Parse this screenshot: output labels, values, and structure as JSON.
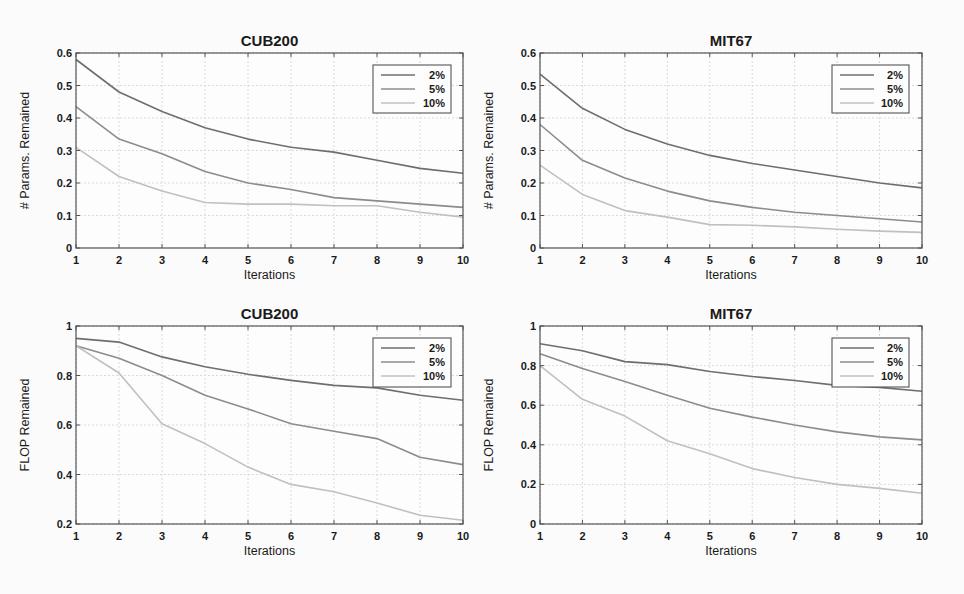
{
  "chart_data": [
    {
      "type": "line",
      "id": "cub200-params",
      "title": "CUB200",
      "xlabel": "Iterations",
      "ylabel": "# Params. Remained",
      "x": [
        1,
        2,
        3,
        4,
        5,
        6,
        7,
        8,
        9,
        10
      ],
      "xlim": [
        1,
        10
      ],
      "ylim": [
        0,
        0.6
      ],
      "yticks": [
        0,
        0.1,
        0.2,
        0.3,
        0.4,
        0.5,
        0.6
      ],
      "ytick_labels": [
        "0",
        "0.1",
        "0.2",
        "0.3",
        "0.4",
        "0.5",
        "0.6"
      ],
      "grid": true,
      "legend_position": "upper right",
      "series": [
        {
          "name": "2%",
          "values": [
            0.58,
            0.48,
            0.42,
            0.37,
            0.335,
            0.31,
            0.295,
            0.27,
            0.245,
            0.23
          ]
        },
        {
          "name": "5%",
          "values": [
            0.435,
            0.335,
            0.29,
            0.235,
            0.2,
            0.18,
            0.155,
            0.145,
            0.135,
            0.125
          ]
        },
        {
          "name": "10%",
          "values": [
            0.31,
            0.22,
            0.175,
            0.14,
            0.135,
            0.135,
            0.13,
            0.13,
            0.11,
            0.095
          ]
        }
      ],
      "frame": {
        "left": 76,
        "top": 53,
        "right": 463,
        "bottom": 248
      },
      "legend_box": {
        "x": 373,
        "y": 65,
        "w": 78,
        "h": 48
      }
    },
    {
      "type": "line",
      "id": "mit67-params",
      "title": "MIT67",
      "xlabel": "Iterations",
      "ylabel": "# Params. Remained",
      "x": [
        1,
        2,
        3,
        4,
        5,
        6,
        7,
        8,
        9,
        10
      ],
      "xlim": [
        1,
        10
      ],
      "ylim": [
        0,
        0.6
      ],
      "yticks": [
        0,
        0.1,
        0.2,
        0.3,
        0.4,
        0.5,
        0.6
      ],
      "ytick_labels": [
        "0",
        "0.1",
        "0.2",
        "0.3",
        "0.4",
        "0.5",
        "0.6"
      ],
      "grid": true,
      "legend_position": "upper right",
      "series": [
        {
          "name": "2%",
          "values": [
            0.535,
            0.43,
            0.365,
            0.32,
            0.285,
            0.26,
            0.24,
            0.22,
            0.2,
            0.185
          ]
        },
        {
          "name": "5%",
          "values": [
            0.38,
            0.27,
            0.215,
            0.175,
            0.145,
            0.125,
            0.11,
            0.1,
            0.09,
            0.08
          ]
        },
        {
          "name": "10%",
          "values": [
            0.255,
            0.165,
            0.115,
            0.095,
            0.072,
            0.07,
            0.065,
            0.058,
            0.052,
            0.048
          ]
        }
      ],
      "frame": {
        "left": 540,
        "top": 53,
        "right": 922,
        "bottom": 248
      },
      "legend_box": {
        "x": 832,
        "y": 65,
        "w": 77,
        "h": 48
      }
    },
    {
      "type": "line",
      "id": "cub200-flop",
      "title": "CUB200",
      "xlabel": "Iterations",
      "ylabel": "FLOP Remained",
      "x": [
        1,
        2,
        3,
        4,
        5,
        6,
        7,
        8,
        9,
        10
      ],
      "xlim": [
        1,
        10
      ],
      "ylim": [
        0.2,
        1
      ],
      "yticks": [
        0.2,
        0.4,
        0.6,
        0.8,
        1
      ],
      "ytick_labels": [
        "0.2",
        "0.4",
        "0.6",
        "0.8",
        "1"
      ],
      "grid": true,
      "legend_position": "upper right",
      "series": [
        {
          "name": "2%",
          "values": [
            0.95,
            0.935,
            0.875,
            0.835,
            0.805,
            0.78,
            0.76,
            0.75,
            0.72,
            0.7
          ]
        },
        {
          "name": "5%",
          "values": [
            0.92,
            0.87,
            0.8,
            0.72,
            0.665,
            0.605,
            0.575,
            0.545,
            0.47,
            0.44
          ]
        },
        {
          "name": "10%",
          "values": [
            0.92,
            0.81,
            0.605,
            0.525,
            0.43,
            0.36,
            0.33,
            0.285,
            0.235,
            0.215
          ]
        }
      ],
      "frame": {
        "left": 76,
        "top": 326,
        "right": 463,
        "bottom": 524
      },
      "legend_box": {
        "x": 373,
        "y": 338,
        "w": 78,
        "h": 49
      }
    },
    {
      "type": "line",
      "id": "mit67-flop",
      "title": "MIT67",
      "xlabel": "Iterations",
      "ylabel": "FLOP Remained",
      "x": [
        1,
        2,
        3,
        4,
        5,
        6,
        7,
        8,
        9,
        10
      ],
      "xlim": [
        1,
        10
      ],
      "ylim": [
        0,
        1
      ],
      "yticks": [
        0,
        0.2,
        0.4,
        0.6,
        0.8,
        1
      ],
      "ytick_labels": [
        "0",
        "0.2",
        "0.4",
        "0.6",
        "0.8",
        "1"
      ],
      "grid": true,
      "legend_position": "upper right",
      "series": [
        {
          "name": "2%",
          "values": [
            0.91,
            0.875,
            0.82,
            0.805,
            0.77,
            0.745,
            0.725,
            0.7,
            0.69,
            0.67
          ]
        },
        {
          "name": "5%",
          "values": [
            0.86,
            0.785,
            0.72,
            0.65,
            0.585,
            0.54,
            0.5,
            0.465,
            0.44,
            0.425
          ]
        },
        {
          "name": "10%",
          "values": [
            0.8,
            0.63,
            0.545,
            0.42,
            0.355,
            0.28,
            0.235,
            0.2,
            0.18,
            0.155
          ]
        }
      ],
      "frame": {
        "left": 540,
        "top": 326,
        "right": 922,
        "bottom": 524
      },
      "legend_box": {
        "x": 832,
        "y": 338,
        "w": 77,
        "h": 49
      }
    }
  ],
  "style": {
    "series_colors": {
      "2%": "#6e6e6e",
      "5%": "#8c8c8c",
      "10%": "#c0c0c0"
    },
    "axis_color": "#555555",
    "grid_color": "#dadada",
    "background": "#fbfbfb"
  }
}
